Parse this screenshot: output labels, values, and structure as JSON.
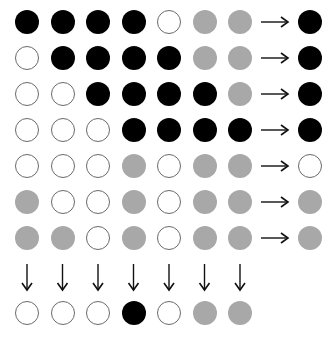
{
  "diagram": {
    "legend_states": {
      "B": "black filled",
      "W": "white outlined",
      "G": "grey filled"
    },
    "colors": {
      "B": "#000000",
      "G": "#a8a8a8",
      "W": "#ffffff",
      "outline": "#6a6a6a",
      "arrow": "#111111"
    },
    "grid": [
      [
        "B",
        "B",
        "B",
        "B",
        "W",
        "G",
        "G"
      ],
      [
        "W",
        "B",
        "B",
        "B",
        "B",
        "G",
        "G"
      ],
      [
        "W",
        "W",
        "B",
        "B",
        "B",
        "B",
        "G"
      ],
      [
        "W",
        "W",
        "W",
        "B",
        "B",
        "B",
        "B"
      ],
      [
        "W",
        "W",
        "W",
        "G",
        "W",
        "G",
        "G"
      ],
      [
        "G",
        "W",
        "W",
        "G",
        "W",
        "G",
        "G"
      ],
      [
        "G",
        "G",
        "W",
        "G",
        "W",
        "G",
        "G"
      ]
    ],
    "row_results": [
      "B",
      "B",
      "B",
      "B",
      "W",
      "G",
      "G"
    ],
    "column_results": [
      "W",
      "W",
      "W",
      "B",
      "W",
      "G",
      "G"
    ],
    "icons": {
      "row_arrow": "right-arrow-icon",
      "column_arrow": "down-arrow-icon"
    }
  }
}
